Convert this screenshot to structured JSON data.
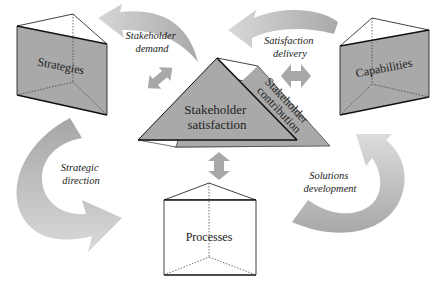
{
  "diagram": {
    "type": "stakeholder-framework",
    "colors": {
      "face_fill": "#a9a9a9",
      "arrow_dark": "#a8a8a8",
      "arrow_light": "#d3d3d3",
      "outline": "#111111",
      "background": "#ffffff"
    },
    "nodes": {
      "strategies": {
        "label": "Strategies"
      },
      "capabilities": {
        "label": "Capabilities"
      },
      "processes": {
        "label": "Processes"
      },
      "center": {
        "satisfaction": {
          "line1": "Stakeholder",
          "line2": "satisfaction"
        },
        "contribution": {
          "line1": "Stakeholder",
          "line2": "contribution"
        }
      }
    },
    "flows": {
      "stakeholder_demand": {
        "line1": "Stakeholder",
        "line2": "demand"
      },
      "satisfaction_delivery": {
        "line1": "Satisfaction",
        "line2": "delivery"
      },
      "strategic_direction": {
        "line1": "Strategic",
        "line2": "direction"
      },
      "solutions_development": {
        "line1": "Solutions",
        "line2": "development"
      }
    }
  }
}
